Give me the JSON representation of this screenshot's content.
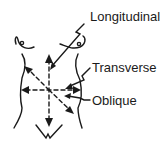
{
  "diagram": {
    "labels": {
      "longitudinal": "Longitudinal",
      "transverse": "Transverse",
      "oblique": "Oblique"
    },
    "colors": {
      "stroke": "#1a1a1a",
      "background": "#ffffff"
    }
  }
}
